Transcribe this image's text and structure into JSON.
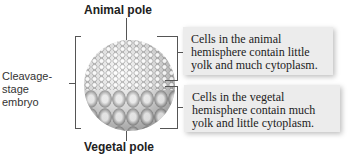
{
  "labels": {
    "animal_pole": "Animal pole",
    "vegetal_pole": "Vegetal pole",
    "embryo_line1": "Cleavage-",
    "embryo_line2": "stage",
    "embryo_line3": "embryo"
  },
  "callouts": [
    {
      "text": "Cells in the animal hemisphere contain little yolk and much cytoplasm."
    },
    {
      "text": "Cells in the vegetal hemisphere contain much yolk and little cytoplasm."
    }
  ]
}
